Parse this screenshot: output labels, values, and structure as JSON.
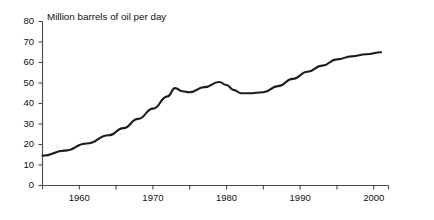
{
  "chart_data": {
    "type": "line",
    "title": "Million barrels of oil per day",
    "xlabel": "",
    "ylabel": "",
    "grid": false,
    "legend": null,
    "xlim": [
      1955,
      2002
    ],
    "ylim": [
      0,
      80
    ],
    "ytick_labels": [
      "0",
      "10",
      "20",
      "30",
      "40",
      "50",
      "60",
      "70",
      "80"
    ],
    "ytick_values": [
      0,
      10,
      20,
      30,
      40,
      50,
      60,
      70,
      80
    ],
    "xtick_labels": [
      "1960",
      "1970",
      "1980",
      "1990",
      "2000"
    ],
    "xtick_values": [
      1960,
      1970,
      1980,
      1990,
      2000
    ],
    "xtick_minor_values": [
      1955,
      1965,
      1975,
      1985,
      1995,
      2002
    ],
    "series": [
      {
        "name": "World oil production",
        "color": "#1c1c1c",
        "x": [
          1955,
          1958,
          1961,
          1964,
          1966,
          1968,
          1970,
          1972,
          1973,
          1974,
          1975,
          1977,
          1979,
          1980,
          1981,
          1982,
          1983,
          1985,
          1987,
          1989,
          1991,
          1993,
          1995,
          1997,
          1999,
          2001
        ],
        "values": [
          14.5,
          17.0,
          20.5,
          24.5,
          28.0,
          32.5,
          37.5,
          43.5,
          47.5,
          46.0,
          45.5,
          48.0,
          50.5,
          49.0,
          46.5,
          45.0,
          45.0,
          45.5,
          48.5,
          52.0,
          55.5,
          58.5,
          61.5,
          63.0,
          64.0,
          65.0
        ]
      }
    ]
  }
}
